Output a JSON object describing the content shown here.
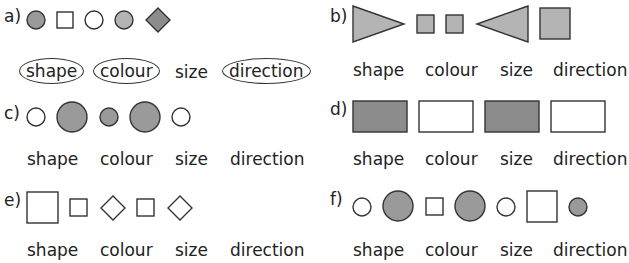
{
  "colors": {
    "stroke": "#333333",
    "dark_gray": "#8c8c8c",
    "mid_gray": "#9a9a9a",
    "light_gray": "#b4b4b4",
    "white": "#ffffff"
  },
  "options": [
    "shape",
    "colour",
    "size",
    "direction"
  ],
  "questions": [
    {
      "id": "a",
      "label": "a)",
      "shapes": [
        "circle mid-gray small",
        "square white small",
        "circle white small",
        "circle light-gray small",
        "diamond mid-gray"
      ],
      "circled": [
        "shape",
        "colour",
        "direction"
      ],
      "option_labels": {
        "shape": "shape",
        "colour": "colour",
        "size": "size",
        "direction": "direction"
      }
    },
    {
      "id": "b",
      "label": "b)",
      "shapes": [
        "triangle right light-gray large",
        "square light-gray small",
        "square light-gray small",
        "triangle left light-gray large",
        "square light-gray large"
      ],
      "circled": [],
      "option_labels": {
        "shape": "shape",
        "colour": "colour",
        "size": "size",
        "direction": "direction"
      }
    },
    {
      "id": "c",
      "label": "c)",
      "shapes": [
        "circle white small",
        "circle gray large",
        "circle gray small",
        "circle gray large",
        "circle white small"
      ],
      "circled": [],
      "option_labels": {
        "shape": "shape",
        "colour": "colour",
        "size": "size",
        "direction": "direction"
      }
    },
    {
      "id": "d",
      "label": "d)",
      "shapes": [
        "rectangle dark-gray",
        "rectangle white",
        "rectangle dark-gray",
        "rectangle white"
      ],
      "circled": [],
      "option_labels": {
        "shape": "shape",
        "colour": "colour",
        "size": "size",
        "direction": "direction"
      }
    },
    {
      "id": "e",
      "label": "e)",
      "shapes": [
        "square white large",
        "square white small",
        "diamond white",
        "square white small",
        "diamond white"
      ],
      "circled": [],
      "option_labels": {
        "shape": "shape",
        "colour": "colour",
        "size": "size",
        "direction": "direction"
      }
    },
    {
      "id": "f",
      "label": "f)",
      "shapes": [
        "circle white small",
        "circle gray large",
        "square white small",
        "circle gray large",
        "circle white small",
        "square white large",
        "circle gray small"
      ],
      "circled": [],
      "option_labels": {
        "shape": "shape",
        "colour": "colour",
        "size": "size",
        "direction": "direction"
      }
    }
  ]
}
